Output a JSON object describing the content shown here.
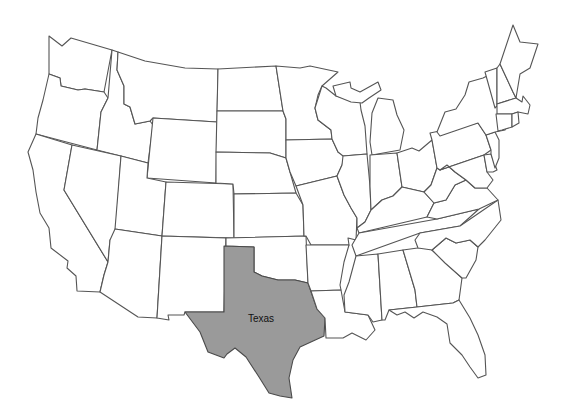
{
  "map": {
    "title": "United States",
    "highlighted_state": {
      "name": "Texas",
      "label": "Texas",
      "fill": "#9a9a9a"
    },
    "default_fill": "#ffffff",
    "stroke": "#555555",
    "states": [
      "Washington",
      "Oregon",
      "California",
      "Idaho",
      "Nevada",
      "Montana",
      "Wyoming",
      "Utah",
      "Arizona",
      "Colorado",
      "New Mexico",
      "North Dakota",
      "South Dakota",
      "Nebraska",
      "Kansas",
      "Oklahoma",
      "Texas",
      "Minnesota",
      "Iowa",
      "Missouri",
      "Arkansas",
      "Louisiana",
      "Wisconsin",
      "Illinois",
      "Michigan",
      "Indiana",
      "Ohio",
      "Kentucky",
      "Tennessee",
      "Mississippi",
      "Alabama",
      "Georgia",
      "Florida",
      "South Carolina",
      "North Carolina",
      "Virginia",
      "West Virginia",
      "Pennsylvania",
      "New York",
      "Vermont",
      "New Hampshire",
      "Maine",
      "Massachusetts",
      "Connecticut",
      "Rhode Island",
      "New Jersey",
      "Delaware",
      "Maryland"
    ]
  }
}
